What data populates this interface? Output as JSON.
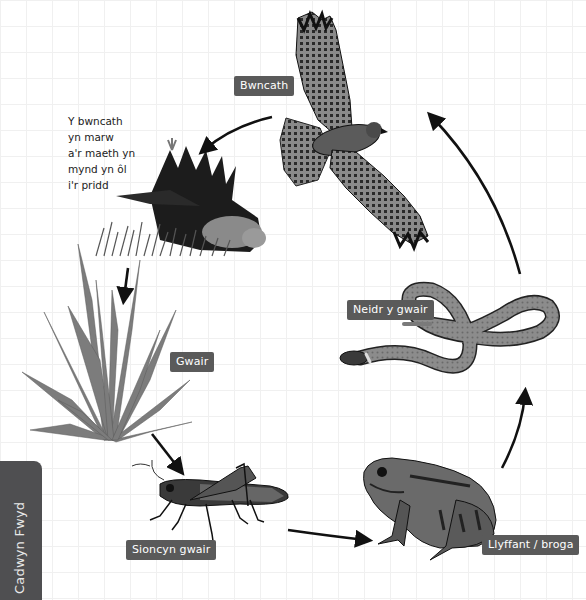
{
  "diagram": {
    "title": "Cadwyn Fwyd",
    "side_tab_label": "Cadwyn Fwyd",
    "background_grid": true,
    "colors": {
      "label_bg": "#5a5a5a",
      "label_text": "#ffffff",
      "side_tab_bg": "#4f4f51",
      "arrow": "#111111",
      "grass": "#7a7a7a"
    },
    "organisms": [
      {
        "id": "buzzard",
        "label": "Bwncath",
        "icon": "buzzard-illustration"
      },
      {
        "id": "dead-buzzard",
        "label": "",
        "icon": "dead-bird-illustration"
      },
      {
        "id": "grass",
        "label": "Gwair",
        "icon": "grass-illustration"
      },
      {
        "id": "grasshopper",
        "label": "Sioncyn gwair",
        "icon": "grasshopper-illustration"
      },
      {
        "id": "frog",
        "label": "Llyffant / broga",
        "icon": "frog-illustration"
      },
      {
        "id": "snake",
        "label": "Neidr y gwair",
        "icon": "snake-illustration"
      }
    ],
    "note": {
      "lines": [
        "Y bwncath",
        "yn marw",
        "a'r maeth yn",
        "mynd yn ôl",
        "i'r pridd"
      ]
    },
    "arrows": [
      {
        "from": "buzzard",
        "to": "dead-buzzard"
      },
      {
        "from": "dead-buzzard",
        "to": "grass"
      },
      {
        "from": "grass",
        "to": "grasshopper"
      },
      {
        "from": "grasshopper",
        "to": "frog"
      },
      {
        "from": "frog",
        "to": "snake"
      },
      {
        "from": "snake",
        "to": "buzzard"
      }
    ]
  }
}
